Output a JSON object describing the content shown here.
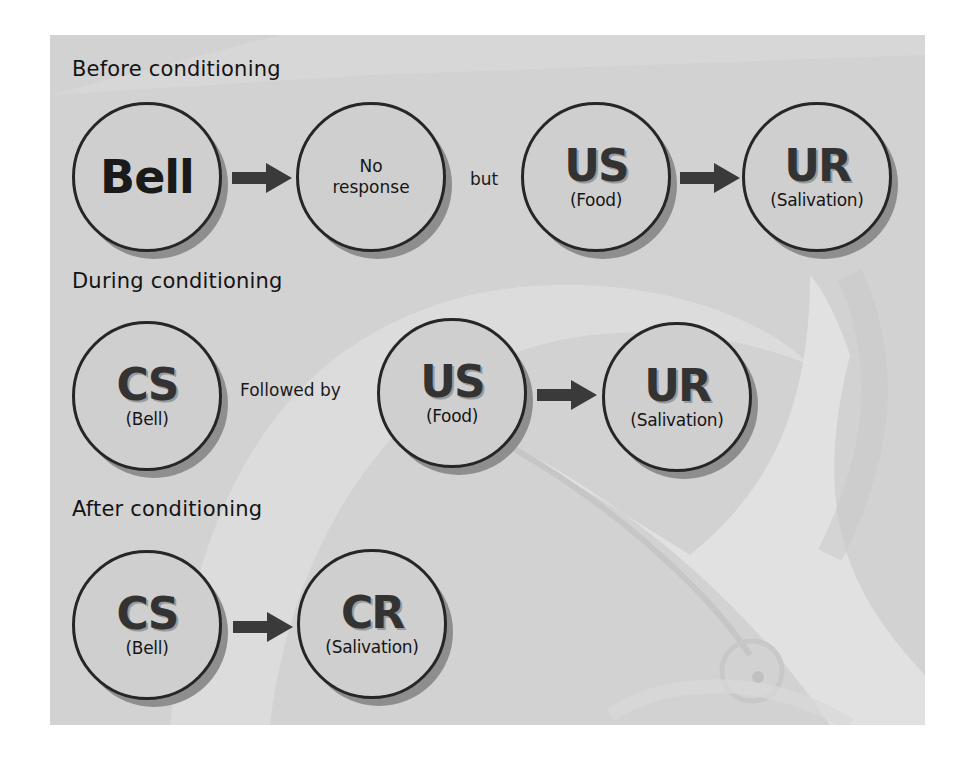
{
  "diagram": {
    "colors": {
      "panel_bg": "#d2d2d2",
      "circle_fill": "#cfcfcf",
      "circle_border": "#262626",
      "circle_shadow": "#8e8e8e",
      "arrow": "#3a3a3a",
      "text": "#141414"
    },
    "sections": [
      {
        "heading": "Before conditioning",
        "nodes": [
          {
            "id": "bell",
            "main": "Bell",
            "sub": ""
          },
          {
            "id": "no-response",
            "main": "No response",
            "line1": "No",
            "line2": "response"
          },
          {
            "id": "us",
            "main": "US",
            "sub": "(Food)"
          },
          {
            "id": "ur",
            "main": "UR",
            "sub": "(Salivation)"
          }
        ],
        "connector_text": "but",
        "arrows": [
          "bell→no-response",
          "us→ur"
        ]
      },
      {
        "heading": "During conditioning",
        "nodes": [
          {
            "id": "cs",
            "main": "CS",
            "sub": "(Bell)"
          },
          {
            "id": "us",
            "main": "US",
            "sub": "(Food)"
          },
          {
            "id": "ur",
            "main": "UR",
            "sub": "(Salivation)"
          }
        ],
        "connector_text": "Followed by",
        "arrows": [
          "us→ur"
        ]
      },
      {
        "heading": "After conditioning",
        "nodes": [
          {
            "id": "cs",
            "main": "CS",
            "sub": "(Bell)"
          },
          {
            "id": "cr",
            "main": "CR",
            "sub": "(Salivation)"
          }
        ],
        "arrows": [
          "cs→cr"
        ]
      }
    ],
    "background_icon": "bell-icon"
  }
}
